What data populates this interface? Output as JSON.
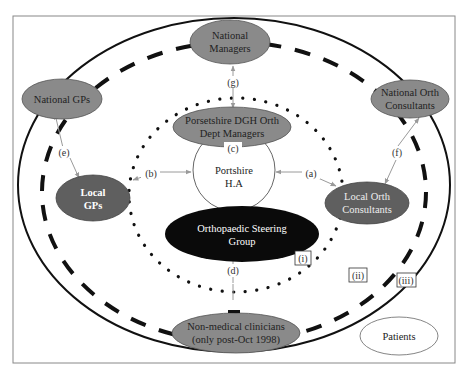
{
  "diagram": {
    "nodes": {
      "national_managers": {
        "line1": "National",
        "line2": "Managers",
        "fill": "#8a8a8a",
        "text_color": "#222222"
      },
      "national_gps": {
        "line1": "National GPs",
        "fill": "#8a8a8a",
        "text_color": "#222222"
      },
      "national_orth_consultants": {
        "line1": "National Orth",
        "line2": "Consultants",
        "fill": "#8a8a8a",
        "text_color": "#222222"
      },
      "dept_managers": {
        "line1": "Porsetshire DGH Orth",
        "line2": "Dept Managers",
        "fill": "#8a8a8a",
        "text_color": "#222222"
      },
      "portshire_ha": {
        "line1": "Portshire",
        "line2": "H.A",
        "fill": "#ffffff",
        "text_color": "#222222"
      },
      "local_gps": {
        "line1": "Local",
        "line2": "GPs",
        "fill": "#5f5f5f",
        "text_color": "#ffffff"
      },
      "local_orth_consultants": {
        "line1": "Local Orth",
        "line2": "Consultants",
        "fill": "#5f5f5f",
        "text_color": "#eeeeee"
      },
      "steering_group": {
        "line1": "Orthopaedic Steering",
        "line2": "Group",
        "fill": "#0a0a0a",
        "text_color": "#ffffff"
      },
      "non_medical_clinicians": {
        "line1": "Non-medical clinicians",
        "line2": "(only post-Oct 1998)",
        "fill": "#8a8a8a",
        "text_color": "#222222"
      },
      "patients": {
        "line1": "Patients",
        "fill": "#ffffff",
        "text_color": "#222222"
      }
    },
    "link_labels": {
      "a": "(a)",
      "b": "(b)",
      "c": "(c)",
      "d": "(d)",
      "e": "(e)",
      "f": "(f)",
      "g": "(g)"
    },
    "boundary_labels": {
      "i": "(i)",
      "ii": "(ii)",
      "iii": "(iii)"
    },
    "colors": {
      "arrow": "#9a9a9a",
      "boundary": "#111111",
      "frame": "#888888"
    }
  }
}
